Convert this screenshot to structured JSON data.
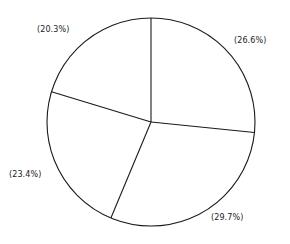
{
  "chart_data": {
    "type": "pie",
    "title": "",
    "subtitle": "",
    "xlabel": "",
    "ylabel": "",
    "grid": false,
    "legend": "none",
    "label_position": "outside",
    "start_angle_deg": 90,
    "direction": "clockwise",
    "categories": [
      "Slice 1",
      "Slice 2",
      "Slice 3",
      "Slice 4"
    ],
    "values": [
      26.6,
      29.7,
      23.4,
      20.3
    ],
    "labels": [
      "(26.6%)",
      "(29.7%)",
      "(23.4%)",
      "(20.3%)"
    ],
    "slices": [
      {
        "label": "(26.6%)",
        "value": 26.6,
        "position": "right"
      },
      {
        "label": "(29.7%)",
        "value": 29.7,
        "position": "bottom-right"
      },
      {
        "label": "(23.4%)",
        "value": 23.4,
        "position": "left"
      },
      {
        "label": "(20.3%)",
        "value": 20.3,
        "position": "top-left"
      }
    ],
    "total_percent": 100.0,
    "colors": {
      "fill": "#ffffff",
      "outline": "#1a1a1a",
      "background": "#ffffff",
      "text": "#1b1b1b"
    },
    "geometry": {
      "center_x": 151,
      "center_y": 122,
      "radius": 104
    }
  },
  "labels": {
    "slice_right": "(26.6%)",
    "slice_bottom_right": "(29.7%)",
    "slice_left": "(23.4%)",
    "slice_top_left": "(20.3%)"
  }
}
